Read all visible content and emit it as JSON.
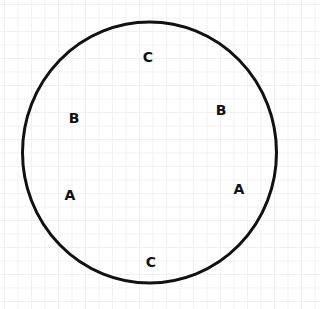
{
  "diagram": {
    "shape": "circle",
    "circle": {
      "cx": 149.5,
      "cy": 152.5,
      "rx": 127,
      "ry": 130.5,
      "stroke": "#111111",
      "stroke_width": 3
    },
    "background": {
      "type": "faint-grid",
      "color": "#f1f1f1"
    },
    "labels": [
      {
        "id": "top-c",
        "text": "C",
        "x": 148,
        "y": 57
      },
      {
        "id": "left-b",
        "text": "B",
        "x": 74,
        "y": 118
      },
      {
        "id": "right-b",
        "text": "B",
        "x": 221,
        "y": 110
      },
      {
        "id": "left-a",
        "text": "A",
        "x": 70,
        "y": 195
      },
      {
        "id": "right-a",
        "text": "A",
        "x": 239,
        "y": 189
      },
      {
        "id": "bottom-c",
        "text": "C",
        "x": 151,
        "y": 262
      }
    ]
  }
}
